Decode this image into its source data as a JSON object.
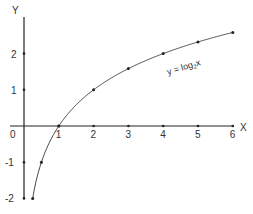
{
  "chart_data": {
    "type": "line",
    "title": "",
    "xlabel": "X",
    "ylabel": "Y",
    "origin_label": "0",
    "annotation": {
      "text": "y = log",
      "subscript": "2",
      "suffix": "x"
    },
    "x_ticks": [
      1,
      2,
      3,
      4,
      5,
      6
    ],
    "x_tick_labels": [
      "1",
      "2",
      "3",
      "4",
      "5",
      "6"
    ],
    "y_ticks": [
      2,
      1,
      -1,
      -2
    ],
    "y_tick_labels": [
      "2",
      "1",
      "-1",
      "-2"
    ],
    "xlim": [
      -0.4,
      6.0
    ],
    "ylim": [
      -2.1,
      3.0
    ],
    "grid": false,
    "series": [
      {
        "name": "y = log2 x",
        "x": [
          0.25,
          0.5,
          1,
          2,
          3,
          4,
          5,
          6
        ],
        "values": [
          -2,
          -1,
          0,
          1,
          1.585,
          2,
          2.322,
          2.585
        ]
      }
    ]
  },
  "colors": {
    "axis": "#222222",
    "curve": "#444444",
    "text": "#333333"
  }
}
